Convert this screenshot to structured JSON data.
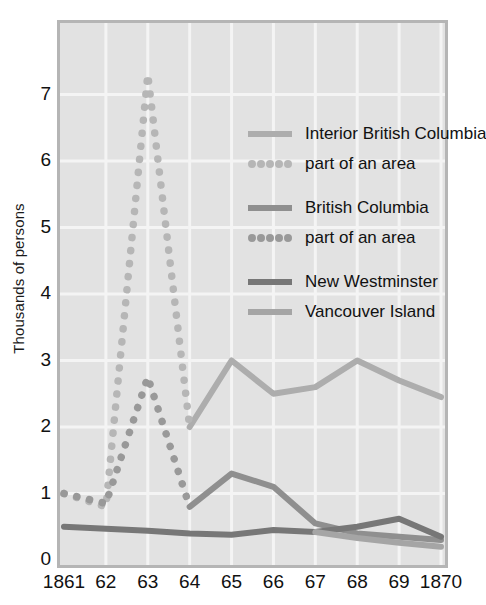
{
  "chart_data": {
    "type": "line",
    "title": "",
    "xlabel": "",
    "ylabel": "Thousands of persons",
    "x": [
      1861,
      1862,
      1863,
      1864,
      1865,
      1866,
      1867,
      1868,
      1869,
      1870
    ],
    "xtick_labels": [
      "1861",
      "62",
      "63",
      "64",
      "65",
      "66",
      "67",
      "68",
      "69",
      "1870"
    ],
    "ytick_labels": [
      "0",
      "1",
      "2",
      "3",
      "4",
      "5",
      "6",
      "7"
    ],
    "ylim": [
      0,
      7.9
    ],
    "yticks": [
      0,
      1,
      2,
      3,
      4,
      5,
      6,
      7
    ],
    "grid": true,
    "legend_position": "upper-right-inside",
    "series": [
      {
        "name": "Interior British Columbia",
        "style": "solid",
        "color": "#adadad",
        "x": [
          1864,
          1865,
          1866,
          1867,
          1868,
          1869,
          1870
        ],
        "values": [
          2.0,
          3.0,
          2.5,
          2.6,
          3.0,
          2.7,
          2.45
        ]
      },
      {
        "name": "part of an area",
        "style": "dotted",
        "color": "#b6b6b6",
        "note": "Interior British Columbia, part of an area",
        "x": [
          1861,
          1862,
          1863,
          1864
        ],
        "values": [
          1.0,
          0.8,
          7.3,
          2.0
        ]
      },
      {
        "name": "British Columbia",
        "style": "solid",
        "color": "#8f8f8f",
        "x": [
          1864,
          1865,
          1866,
          1867,
          1868,
          1869,
          1870
        ],
        "values": [
          0.8,
          1.3,
          1.1,
          0.55,
          0.4,
          0.35,
          0.3
        ]
      },
      {
        "name": "part of an area",
        "style": "dotted",
        "color": "#999999",
        "note": "British Columbia, part of an area",
        "x": [
          1861,
          1862,
          1863,
          1864
        ],
        "values": [
          1.0,
          0.85,
          2.75,
          0.8
        ]
      },
      {
        "name": "New Westminster",
        "style": "solid",
        "color": "#777777",
        "x": [
          1861,
          1862,
          1863,
          1864,
          1865,
          1866,
          1867,
          1868,
          1869,
          1870
        ],
        "values": [
          0.5,
          0.47,
          0.44,
          0.4,
          0.38,
          0.45,
          0.42,
          0.5,
          0.62,
          0.35
        ]
      },
      {
        "name": "Vancouver Island",
        "style": "solid",
        "color": "#a5a5a5",
        "x": [
          1867,
          1868,
          1869,
          1870
        ],
        "values": [
          0.42,
          0.33,
          0.26,
          0.2
        ]
      }
    ]
  },
  "legend": {
    "entries": [
      {
        "label": "Interior British Columbia",
        "style": "solid",
        "color": "#adadad"
      },
      {
        "label": "part of an area",
        "style": "dotted",
        "color": "#b6b6b6"
      },
      {
        "label": "British Columbia",
        "style": "solid",
        "color": "#8f8f8f"
      },
      {
        "label": "part of an area",
        "style": "dotted",
        "color": "#999999"
      },
      {
        "label": "New Westminster",
        "style": "solid",
        "color": "#777777"
      },
      {
        "label": "Vancouver Island",
        "style": "solid",
        "color": "#a5a5a5"
      }
    ]
  },
  "colors": {
    "plot_background": "#e2e2e2",
    "frame": "#b5b5b5",
    "gridline": "#f4f4f4",
    "text": "#111111"
  }
}
